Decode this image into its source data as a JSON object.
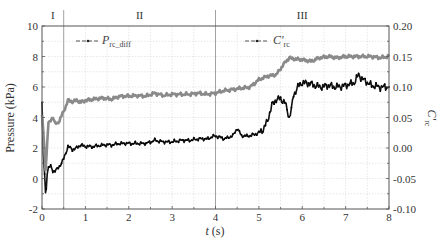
{
  "chart_data": {
    "type": "line",
    "title": "",
    "xlabel": "t (s)",
    "ylabel": "Pressure (kPa)",
    "ylabel_right": "C'rc",
    "xlim": [
      0,
      8
    ],
    "ylim": [
      -2,
      10
    ],
    "ylim_right": [
      -0.1,
      0.2
    ],
    "x_ticks": [
      "0",
      "1",
      "2",
      "3",
      "4",
      "5",
      "6",
      "7",
      "8"
    ],
    "y_ticks": [
      "-2",
      "0",
      "2",
      "4",
      "6",
      "8",
      "10"
    ],
    "y_ticks_right": [
      "-0.10",
      "-0.05",
      "0.00",
      "0.05",
      "0.10",
      "0.15",
      "0.20"
    ],
    "grid": true,
    "phases": [
      {
        "label": "I",
        "x_start": 0,
        "x_end": 0.5
      },
      {
        "label": "II",
        "x_start": 0.5,
        "x_end": 4
      },
      {
        "label": "III",
        "x_start": 4,
        "x_end": 8
      }
    ],
    "phase_boundaries": [
      0.5,
      4
    ],
    "series": [
      {
        "name": "P_rc_diff",
        "legend_main": "P",
        "legend_sub": "rc_diff",
        "axis": "left",
        "color": "#111111",
        "marker": "dot",
        "x": [
          0.0,
          0.03,
          0.06,
          0.08,
          0.1,
          0.12,
          0.15,
          0.2,
          0.25,
          0.3,
          0.35,
          0.4,
          0.45,
          0.5,
          0.55,
          0.6,
          0.7,
          0.8,
          0.9,
          1.0,
          1.2,
          1.4,
          1.6,
          1.8,
          2.0,
          2.2,
          2.4,
          2.6,
          2.8,
          3.0,
          3.2,
          3.4,
          3.6,
          3.8,
          4.0,
          4.2,
          4.4,
          4.5,
          4.6,
          4.8,
          5.0,
          5.1,
          5.2,
          5.3,
          5.4,
          5.5,
          5.6,
          5.7,
          5.75,
          5.8,
          5.9,
          6.0,
          6.2,
          6.4,
          6.6,
          6.8,
          7.0,
          7.2,
          7.3,
          7.4,
          7.6,
          7.8,
          8.0
        ],
        "values": [
          5.0,
          1.5,
          0.3,
          -1.0,
          -0.6,
          0.4,
          0.7,
          0.8,
          0.5,
          0.5,
          0.6,
          0.8,
          1.0,
          1.3,
          1.7,
          2.1,
          1.9,
          2.0,
          2.2,
          2.1,
          2.1,
          2.2,
          2.2,
          2.3,
          2.3,
          2.3,
          2.3,
          2.5,
          2.4,
          2.4,
          2.5,
          2.5,
          2.6,
          2.6,
          2.8,
          2.6,
          2.8,
          3.3,
          2.8,
          2.8,
          3.0,
          3.2,
          3.8,
          4.8,
          5.2,
          5.2,
          5.0,
          4.0,
          4.5,
          5.5,
          6.0,
          6.3,
          6.2,
          6.0,
          6.1,
          6.0,
          6.1,
          6.3,
          6.8,
          6.5,
          6.1,
          6.0,
          6.0
        ]
      },
      {
        "name": "C'rc",
        "legend_main": "C'",
        "legend_sub": "rc",
        "axis": "right",
        "color": "#8a8a8a",
        "marker": "dot",
        "x": [
          0.0,
          0.04,
          0.08,
          0.1,
          0.12,
          0.15,
          0.2,
          0.25,
          0.3,
          0.35,
          0.4,
          0.5,
          0.6,
          0.7,
          0.8,
          0.9,
          1.0,
          1.2,
          1.4,
          1.6,
          1.8,
          2.0,
          2.2,
          2.4,
          2.6,
          2.8,
          3.0,
          3.2,
          3.4,
          3.6,
          3.8,
          4.0,
          4.2,
          4.4,
          4.6,
          4.8,
          5.0,
          5.2,
          5.4,
          5.6,
          5.7,
          5.8,
          6.0,
          6.2,
          6.4,
          6.6,
          6.8,
          7.0,
          7.2,
          7.4,
          7.6,
          7.8,
          8.0
        ],
        "values": [
          0.055,
          0.015,
          -0.035,
          -0.02,
          0.01,
          0.04,
          0.045,
          0.052,
          0.04,
          0.04,
          0.045,
          0.06,
          0.078,
          0.076,
          0.078,
          0.075,
          0.078,
          0.08,
          0.082,
          0.08,
          0.085,
          0.085,
          0.086,
          0.085,
          0.09,
          0.086,
          0.088,
          0.088,
          0.088,
          0.09,
          0.088,
          0.09,
          0.094,
          0.096,
          0.098,
          0.1,
          0.112,
          0.118,
          0.12,
          0.14,
          0.148,
          0.146,
          0.145,
          0.142,
          0.148,
          0.15,
          0.148,
          0.15,
          0.15,
          0.15,
          0.15,
          0.148,
          0.15
        ]
      }
    ],
    "legend_position": "top, inline entries at upper-left (P) and upper-center-right (C')"
  },
  "axes": {
    "x_title_italic": "t",
    "x_title_unit": " (s)",
    "y_left_title": "Pressure (kPa)",
    "y_right_title_main": "C'",
    "y_right_title_sub": "rc"
  }
}
